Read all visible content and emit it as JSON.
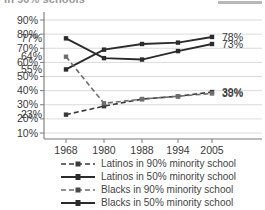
{
  "header": {
    "title": "in 90% schools",
    "swatch_color": "#b8b8b8"
  },
  "chart_data": {
    "type": "line",
    "title": "in 90% schools",
    "xlabel": "",
    "ylabel": "",
    "x": [
      1968,
      1980,
      1988,
      1994,
      2005
    ],
    "categories": [
      "1968",
      "1980",
      "1988",
      "1994",
      "2005"
    ],
    "ylim": [
      10,
      90
    ],
    "yticks": [
      10,
      20,
      30,
      40,
      50,
      60,
      70,
      80,
      90
    ],
    "ytick_labels": [
      "10%",
      "20%",
      "30%",
      "40%",
      "50%",
      "60%",
      "70%",
      "80%",
      "90%"
    ],
    "grid": true,
    "legend_position": "bottom",
    "series": [
      {
        "name": "Latinos in 90% minority school",
        "style": "dashed",
        "color": "#3a3a3a",
        "values": [
          23,
          29,
          34,
          36,
          39
        ]
      },
      {
        "name": "Latinos in 50% minority school",
        "style": "solid",
        "color": "#2b2b2b",
        "values": [
          55,
          69,
          73,
          74,
          78
        ]
      },
      {
        "name": "Blacks in 90% minority school",
        "style": "dashed",
        "color": "#6e6e6e",
        "values": [
          64,
          31,
          34,
          36,
          38
        ]
      },
      {
        "name": "Blacks in 50% minority school",
        "style": "solid",
        "color": "#2b2b2b",
        "values": [
          77,
          63,
          62,
          68,
          73
        ]
      }
    ],
    "annotations": [
      {
        "text": "77%",
        "value": 77,
        "year": 1968,
        "side": "left"
      },
      {
        "text": "64%",
        "value": 64,
        "year": 1968,
        "side": "left"
      },
      {
        "text": "55%",
        "value": 55,
        "year": 1968,
        "side": "left"
      },
      {
        "text": "23%",
        "value": 23,
        "year": 1968,
        "side": "left"
      },
      {
        "text": "78%",
        "value": 78,
        "year": 2005,
        "side": "right"
      },
      {
        "text": "73%",
        "value": 73,
        "year": 2005,
        "side": "right"
      },
      {
        "text": "39%",
        "value": 39,
        "year": 2005,
        "side": "right"
      },
      {
        "text": "38%",
        "value": 38,
        "year": 2005,
        "side": "right"
      }
    ]
  },
  "legend": {
    "items": [
      {
        "label": "Latinos in 90% minority school",
        "style": "dashed"
      },
      {
        "label": "Latinos in 50% minority school",
        "style": "solid"
      },
      {
        "label": "Blacks in 90% minority school",
        "style": "dashed"
      },
      {
        "label": "Blacks in 50% minority school",
        "style": "solid"
      }
    ]
  }
}
